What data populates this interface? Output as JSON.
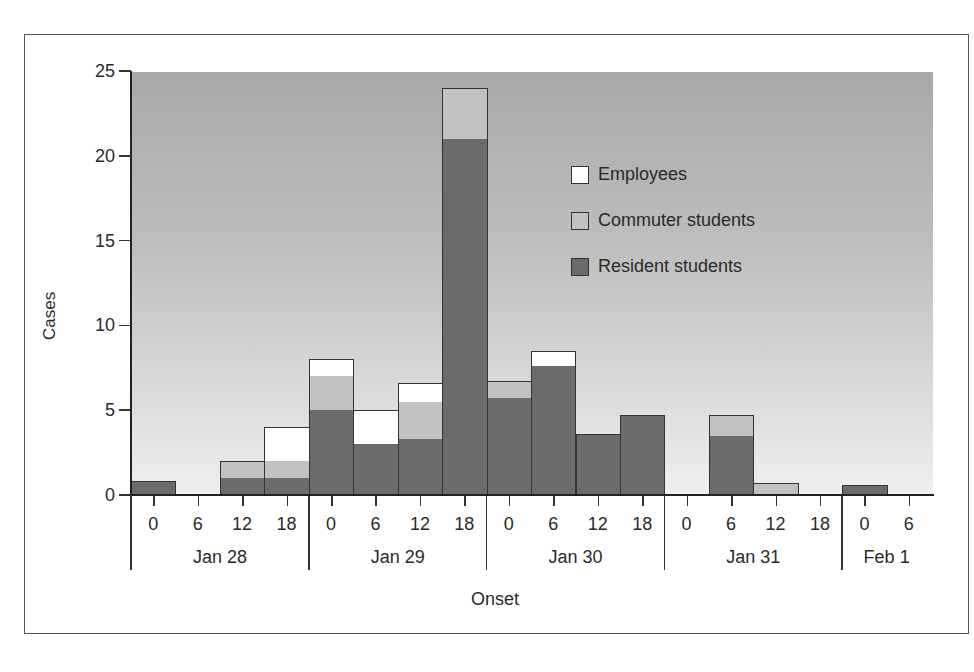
{
  "chart_data": {
    "type": "bar",
    "stacked": true,
    "title": "",
    "xlabel": "Onset",
    "ylabel": "Cases",
    "ylim": [
      0,
      25
    ],
    "yticks": [
      0,
      5,
      10,
      15,
      20,
      25
    ],
    "bin_hours": 6,
    "days": [
      "Jan 28",
      "Jan 29",
      "Jan 30",
      "Jan 31",
      "Feb 1"
    ],
    "categories": [
      "Jan 28 0",
      "Jan 28 6",
      "Jan 28 12",
      "Jan 28 18",
      "Jan 29 0",
      "Jan 29 6",
      "Jan 29 12",
      "Jan 29 18",
      "Jan 30 0",
      "Jan 30 6",
      "Jan 30 12",
      "Jan 30 18",
      "Jan 31 0",
      "Jan 31 6",
      "Jan 31 12",
      "Jan 31 18",
      "Feb 1 0",
      "Feb 1 6"
    ],
    "tick_labels": [
      "0",
      "6",
      "12",
      "18",
      "0",
      "6",
      "12",
      "18",
      "0",
      "6",
      "12",
      "18",
      "0",
      "6",
      "12",
      "18",
      "0",
      "6"
    ],
    "series": [
      {
        "name": "Resident students",
        "color": "#6b6b6b",
        "values": [
          0.8,
          0,
          1,
          1,
          5,
          3,
          3.3,
          21,
          5.7,
          7.6,
          3.6,
          4.7,
          0,
          3.5,
          0,
          0,
          0.6,
          0
        ]
      },
      {
        "name": "Commuter students",
        "color": "#c2c2c2",
        "values": [
          0,
          0,
          1,
          1,
          2,
          0,
          2.2,
          3,
          1,
          0,
          0,
          0,
          0,
          1.2,
          0.7,
          0,
          0,
          0
        ]
      },
      {
        "name": "Employees",
        "color": "#ffffff",
        "values": [
          0,
          0,
          0,
          2,
          1,
          2,
          1.1,
          0,
          0,
          0.9,
          0,
          0,
          0,
          0,
          0,
          0,
          0,
          0
        ]
      }
    ],
    "legend": {
      "position": "upper-right-inside",
      "entries": [
        "Employees",
        "Commuter students",
        "Resident students"
      ]
    },
    "grid": false
  }
}
